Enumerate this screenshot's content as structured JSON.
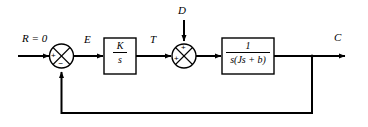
{
  "diagram": {
    "type": "control-system-block-diagram",
    "background_color": "#ffffff",
    "line_color": "#000000",
    "signals": {
      "reference": "R = 0",
      "error": "E",
      "torque": "T",
      "disturbance": "D",
      "output": "C"
    },
    "blocks": [
      {
        "name": "controller",
        "numerator": "K",
        "denominator": "s"
      },
      {
        "name": "plant",
        "numerator": "1",
        "denominator": "s(Js + b)"
      }
    ],
    "summing_junctions": [
      {
        "name": "error-junction",
        "input_sign": "+",
        "feedback_sign": "−"
      },
      {
        "name": "disturbance-junction",
        "input_sign": "+",
        "disturbance_sign": "+"
      }
    ]
  }
}
